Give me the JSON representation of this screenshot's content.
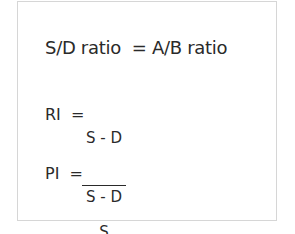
{
  "formulas": {
    "sd_ratio": {
      "text": "S/D ratio  = A/B ratio"
    },
    "ri": {
      "lhs": "RI  =",
      "numerator": "S - D",
      "denominator": "S"
    },
    "pi": {
      "lhs": "PI  =",
      "numerator": "S - D",
      "denominator": "V"
    }
  }
}
